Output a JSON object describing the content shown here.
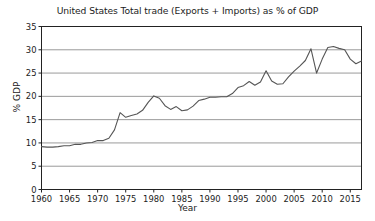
{
  "chart_data": {
    "type": "line",
    "title": "United States Total trade (Exports + Imports) as % of GDP",
    "xlabel": "Year",
    "ylabel": "% GDP",
    "xlim": [
      1960,
      2017
    ],
    "ylim": [
      0,
      35
    ],
    "ytick_labels": [
      "0",
      "5",
      "10",
      "15",
      "20",
      "25",
      "30",
      "35"
    ],
    "yticks": [
      0,
      5,
      10,
      15,
      20,
      25,
      30,
      35
    ],
    "xtick_labels": [
      "1960",
      "1965",
      "1970",
      "1975",
      "1980",
      "1985",
      "1990",
      "1995",
      "2000",
      "2005",
      "2010",
      "2015"
    ],
    "xticks": [
      1960,
      1965,
      1970,
      1975,
      1980,
      1985,
      1990,
      1995,
      2000,
      2005,
      2010,
      2015
    ],
    "grid": "horizontal",
    "legend": "none",
    "line_color": "#555555",
    "grid_color": "#9a9a9a",
    "axis_color": "#222222",
    "background_color": "#ffffff",
    "x": [
      1960,
      1961,
      1962,
      1963,
      1964,
      1965,
      1966,
      1967,
      1968,
      1969,
      1970,
      1971,
      1972,
      1973,
      1974,
      1975,
      1976,
      1977,
      1978,
      1979,
      1980,
      1981,
      1982,
      1983,
      1984,
      1985,
      1986,
      1987,
      1988,
      1989,
      1990,
      1991,
      1992,
      1993,
      1994,
      1995,
      1996,
      1997,
      1998,
      1999,
      2000,
      2001,
      2002,
      2003,
      2004,
      2005,
      2006,
      2007,
      2008,
      2009,
      2010,
      2011,
      2012,
      2013,
      2014,
      2015,
      2016,
      2017
    ],
    "values": [
      9.2,
      9.1,
      9.1,
      9.2,
      9.4,
      9.4,
      9.7,
      9.7,
      10.0,
      10.1,
      10.5,
      10.5,
      11.0,
      12.8,
      16.5,
      15.5,
      15.9,
      16.2,
      17.0,
      18.7,
      20.1,
      19.6,
      18.0,
      17.2,
      17.8,
      16.9,
      17.1,
      17.9,
      19.1,
      19.4,
      19.8,
      19.8,
      19.9,
      19.9,
      20.6,
      21.9,
      22.3,
      23.2,
      22.4,
      23.1,
      25.5,
      23.3,
      22.6,
      22.7,
      24.2,
      25.4,
      26.5,
      27.7,
      30.2,
      25.0,
      28.0,
      30.5,
      30.7,
      30.3,
      30.0,
      28.0,
      27.0,
      27.6
    ]
  }
}
